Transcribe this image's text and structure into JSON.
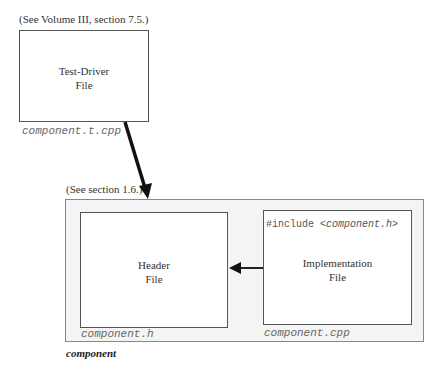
{
  "test_driver": {
    "note": "(See Volume III, section 7.5.)",
    "title_line1": "Test-Driver",
    "title_line2": "File",
    "filename": "component.t.cpp"
  },
  "component": {
    "note": "(See section 1.6.)",
    "label": "component",
    "header": {
      "title_line1": "Header",
      "title_line2": "File",
      "filename": "component.h"
    },
    "implementation": {
      "include_prefix": "#include <",
      "include_name": "component.h",
      "include_suffix": ">",
      "title_line1": "Implementation",
      "title_line2": "File",
      "filename": "component.cpp"
    }
  },
  "arrows": [
    {
      "from": "test_driver",
      "to": "component"
    },
    {
      "from": "implementation",
      "to": "header"
    }
  ]
}
